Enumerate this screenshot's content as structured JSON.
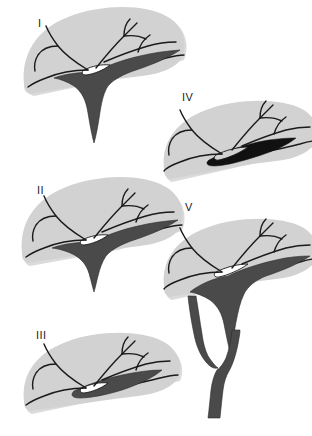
{
  "diagram": {
    "kind": "line-drawing-plate",
    "background_color": "#ffffff",
    "parenchyma_color": "#d2d2d2",
    "parenchyma_shadow_color": "#bdbdbd",
    "duct_dark_color": "#4a4a4a",
    "duct_black_color": "#111111",
    "stroke_color": "#1a1a1a",
    "figure_count": 5
  },
  "figures": [
    {
      "id": "figure-1",
      "label": "I",
      "label_x": 38,
      "label_y": 27,
      "duct_style": "long-descending-common-duct",
      "description": "Liver parenchyma with branching intrahepatic ducts converging to a wide hilar confluence and a single long tapering common duct descending below the liver margin."
    },
    {
      "id": "figure-2",
      "label": "II",
      "label_x": 37,
      "label_y": 194,
      "duct_style": "short-descending-common-duct",
      "description": "Similar confluence to type I but with a short stubby common duct that barely projects below the inferior liver border."
    },
    {
      "id": "figure-3",
      "label": "III",
      "label_x": 36,
      "label_y": 339,
      "duct_style": "lens-confluence-no-descending-duct",
      "description": "Confluence forms a dark lens-shaped reservoir along the inferior border with no descending extrahepatic duct visible."
    },
    {
      "id": "figure-4",
      "label": "IV",
      "label_x": 182,
      "label_y": 101,
      "duct_style": "thin-black-sliver-confluence",
      "description": "Flattened liver silhouette with a thin black sliver-shaped confluence hugging the inferior margin and no descending duct."
    },
    {
      "id": "figure-5",
      "label": "V",
      "label_x": 185,
      "label_y": 211,
      "duct_style": "looped-double-duct",
      "description": "Confluence drains into two parallel ducts that enclose an elongated loop before rejoining into a single duct continuing inferiorly."
    }
  ]
}
